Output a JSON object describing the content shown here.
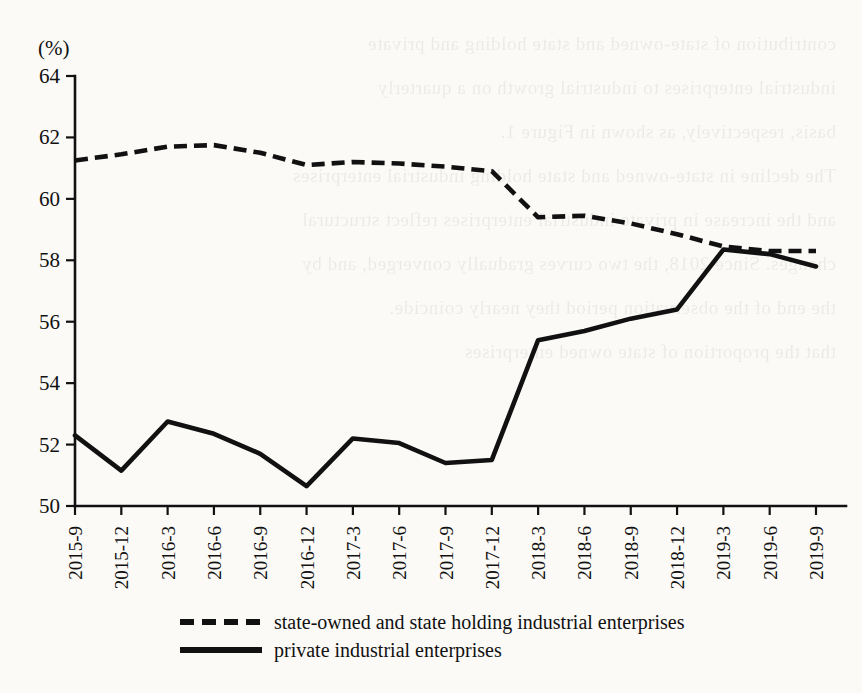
{
  "unit_label": "(%)",
  "background_bleed_lines": [
    "contribution of state-owned and state holding and private",
    "industrial enterprises to industrial growth on a quarterly",
    "basis, respectively, as shown in Figure 1.",
    "",
    "The decline in state-owned and state holding industrial enterprises",
    "and the increase in private industrial enterprises reflect structural",
    "changes. Since 2018, the two curves gradually converged, and by",
    "the end of the observation period they nearly coincide.",
    "",
    "",
    "",
    "",
    "",
    "",
    "that the proportion of state owned enterprises"
  ],
  "legend": {
    "position": "bottom",
    "items": [
      {
        "label": "state-owned and state holding industrial enterprises",
        "style": "dashed"
      },
      {
        "label": "private industrial enterprises",
        "style": "solid"
      }
    ]
  },
  "chart_data": {
    "type": "line",
    "title": "",
    "subtitle": "",
    "xlabel": "",
    "ylabel": "(%)",
    "ylim": [
      50,
      64
    ],
    "yticks": [
      50,
      52,
      54,
      56,
      58,
      60,
      62,
      64
    ],
    "grid": false,
    "x": [
      "2015-9",
      "2015-12",
      "2016-3",
      "2016-6",
      "2016-9",
      "2016-12",
      "2017-3",
      "2017-6",
      "2017-9",
      "2017-12",
      "2018-3",
      "2018-6",
      "2018-9",
      "2018-12",
      "2019-3",
      "2019-6",
      "2019-9"
    ],
    "categories": [
      "2015-9",
      "2015-12",
      "2016-3",
      "2016-6",
      "2016-9",
      "2016-12",
      "2017-3",
      "2017-6",
      "2017-9",
      "2017-12",
      "2018-3",
      "2018-6",
      "2018-9",
      "2018-12",
      "2019-3",
      "2019-6",
      "2019-9"
    ],
    "series": [
      {
        "name": "state-owned and state holding industrial enterprises",
        "style": "dashed",
        "color": "#111111",
        "values": [
          61.25,
          61.45,
          61.7,
          61.75,
          61.5,
          61.1,
          61.2,
          61.15,
          61.05,
          60.9,
          59.4,
          59.45,
          59.2,
          58.85,
          58.45,
          58.3,
          58.3
        ]
      },
      {
        "name": "private industrial enterprises",
        "style": "solid",
        "color": "#111111",
        "values": [
          52.3,
          51.15,
          52.75,
          52.35,
          51.7,
          50.65,
          52.2,
          52.05,
          51.4,
          51.5,
          55.4,
          55.7,
          56.1,
          56.4,
          58.35,
          58.2,
          57.8
        ]
      }
    ]
  }
}
